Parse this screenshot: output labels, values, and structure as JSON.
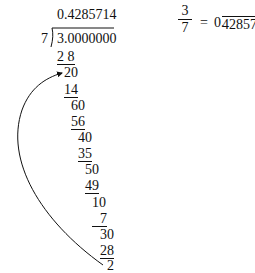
{
  "division": {
    "quotient": "0.4285714",
    "divisor": "7",
    "dividend": "3.0000000",
    "steps": [
      {
        "value": "2 8",
        "underline": true
      },
      {
        "value": "20",
        "underline": false
      },
      {
        "value": "14",
        "underline": true
      },
      {
        "value": "60",
        "underline": false
      },
      {
        "value": "56",
        "underline": true
      },
      {
        "value": "40",
        "underline": false
      },
      {
        "value": "35",
        "underline": true
      },
      {
        "value": "50",
        "underline": false
      },
      {
        "value": "49",
        "underline": true
      },
      {
        "value": "10",
        "underline": false
      },
      {
        "value": "7",
        "underline": true
      },
      {
        "value": "30",
        "underline": false
      },
      {
        "value": "28",
        "underline": true
      },
      {
        "value": "2",
        "underline": false
      }
    ]
  },
  "result": {
    "numerator": "3",
    "denominator": "7",
    "equals": "=",
    "leading": "0.",
    "repeating": "428571"
  },
  "arrow": {
    "from": "remainder 2",
    "to": "remainder 20",
    "meaning": "repeating cycle"
  }
}
